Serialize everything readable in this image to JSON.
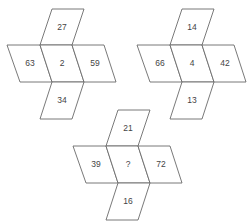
{
  "puzzle": {
    "figures": [
      {
        "top": "27",
        "left": "63",
        "center": "2",
        "right": "59",
        "bottom": "34"
      },
      {
        "top": "14",
        "left": "66",
        "center": "4",
        "right": "42",
        "bottom": "13"
      },
      {
        "top": "21",
        "left": "39",
        "center": "?",
        "right": "72",
        "bottom": "16"
      }
    ]
  }
}
